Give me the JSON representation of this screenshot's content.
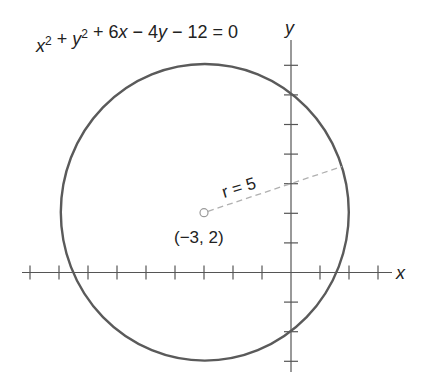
{
  "figure": {
    "equation": {
      "parts": [
        {
          "t": "x",
          "italic": true
        },
        {
          "t": "2",
          "sup": true
        },
        {
          "t": " + "
        },
        {
          "t": "y",
          "italic": true
        },
        {
          "t": "2",
          "sup": true
        },
        {
          "t": " + 6"
        },
        {
          "t": "x",
          "italic": true
        },
        {
          "t": " − 4"
        },
        {
          "t": "y",
          "italic": true
        },
        {
          "t": " − 12 = 0"
        }
      ],
      "text": "x² + y² + 6x − 4y − 12 = 0"
    },
    "x_axis_label": "x",
    "y_axis_label": "y",
    "radius_label": "r = 5",
    "center_label": "(−3, 2)",
    "colors": {
      "circle": "#5a5a5a",
      "axes": "#555555",
      "radius_line": "#b0b0b0",
      "text": "#222222"
    }
  },
  "chart_data": {
    "type": "diagram",
    "xlabel": "x",
    "ylabel": "y",
    "xlim": [
      -9,
      3.5
    ],
    "ylim": [
      -3.3,
      7.9
    ],
    "x_ticks": [
      -9,
      -8,
      -7,
      -6,
      -5,
      -4,
      -3,
      -2,
      -1,
      1,
      2,
      3
    ],
    "y_ticks": [
      -3,
      -2,
      -1,
      1,
      2,
      3,
      4,
      5,
      6,
      7
    ],
    "tick_labels_shown": false,
    "grid": false,
    "circle": {
      "center": [
        -3,
        2
      ],
      "radius": 5
    },
    "annotations": [
      {
        "text": "r = 5",
        "type": "radius-dashed-segment",
        "from": [
          -3,
          2
        ],
        "to": [
          1.77,
          3.53
        ]
      },
      {
        "text": "(−3, 2)",
        "type": "point-label",
        "at": [
          -3,
          2
        ]
      }
    ]
  }
}
